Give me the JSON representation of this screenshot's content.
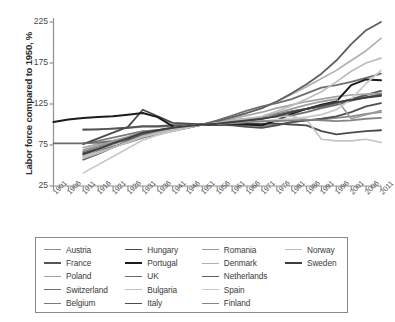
{
  "chart_data": {
    "type": "line",
    "title": "",
    "xlabel": "",
    "ylabel": "Labor force compared to 1950, %",
    "xlim": [
      1901,
      2011
    ],
    "ylim": [
      25,
      235
    ],
    "yticks": [
      25,
      75,
      125,
      175,
      225
    ],
    "grid": false,
    "legend_position": "below-plot",
    "x": [
      1901,
      1906,
      1911,
      1916,
      1921,
      1926,
      1931,
      1936,
      1941,
      1946,
      1951,
      1956,
      1961,
      1966,
      1971,
      1976,
      1981,
      1986,
      1991,
      1996,
      2001,
      2006,
      2011
    ],
    "series": [
      {
        "name": "Austria",
        "color": "#8c8c8c",
        "width": 1.7,
        "values": [
          null,
          null,
          93,
          94,
          95,
          96,
          97,
          97,
          98,
          99,
          100,
          100,
          100,
          99,
          98,
          100,
          103,
          105,
          106,
          108,
          110,
          113,
          115
        ]
      },
      {
        "name": "France",
        "color": "#555555",
        "width": 1.9,
        "values": [
          null,
          null,
          94,
          94,
          95,
          96,
          98,
          98,
          99,
          99,
          100,
          100,
          102,
          104,
          107,
          112,
          116,
          119,
          122,
          126,
          131,
          136,
          141
        ]
      },
      {
        "name": "Poland",
        "color": "#a3a3a3",
        "width": 1.7,
        "values": [
          null,
          null,
          72,
          76,
          80,
          84,
          88,
          90,
          93,
          96,
          100,
          103,
          107,
          111,
          115,
          120,
          124,
          128,
          131,
          134,
          136,
          137,
          138
        ]
      },
      {
        "name": "Switzerland",
        "color": "#6e6e6e",
        "width": 1.8,
        "values": [
          null,
          null,
          63,
          68,
          73,
          78,
          84,
          88,
          92,
          96,
          100,
          105,
          111,
          117,
          122,
          126,
          131,
          138,
          145,
          148,
          152,
          157,
          162
        ]
      },
      {
        "name": "Belgium",
        "color": "#7a7a7a",
        "width": 1.8,
        "values": [
          null,
          null,
          77,
          80,
          84,
          88,
          92,
          93,
          95,
          97,
          100,
          101,
          103,
          106,
          109,
          113,
          116,
          119,
          122,
          126,
          130,
          133,
          136
        ]
      },
      {
        "name": "Hungary",
        "color": "#4a4a4a",
        "width": 1.8,
        "values": [
          null,
          null,
          76,
          83,
          90,
          97,
          118,
          110,
          102,
          101,
          100,
          100,
          100,
          101,
          101,
          101,
          100,
          99,
          92,
          88,
          90,
          92,
          93
        ]
      },
      {
        "name": "Portugal",
        "color": "#1c1c1c",
        "width": 2.0,
        "values": [
          103,
          106,
          108,
          109,
          110,
          112,
          114,
          109,
          98,
          null,
          100,
          100,
          100,
          100,
          99,
          105,
          113,
          119,
          124,
          128,
          148,
          155,
          154
        ]
      },
      {
        "name": "UK",
        "color": "#6b6b6b",
        "width": 1.8,
        "values": [
          77,
          77,
          77,
          78,
          80,
          82,
          86,
          89,
          93,
          96,
          100,
          102,
          105,
          107,
          108,
          110,
          111,
          115,
          120,
          124,
          129,
          133,
          137
        ]
      },
      {
        "name": "Bulgaria",
        "color": "#c4c4c4",
        "width": 1.7,
        "values": [
          null,
          null,
          60,
          66,
          72,
          78,
          85,
          89,
          93,
          96,
          100,
          102,
          105,
          107,
          109,
          110,
          110,
          106,
          82,
          80,
          80,
          82,
          78
        ]
      },
      {
        "name": "Italy",
        "color": "#4f4f4f",
        "width": 1.8,
        "values": [
          null,
          null,
          66,
          71,
          76,
          82,
          88,
          91,
          94,
          97,
          100,
          100,
          99,
          97,
          96,
          99,
          103,
          105,
          107,
          110,
          115,
          122,
          126
        ]
      },
      {
        "name": "Romania",
        "color": "#9b9b9b",
        "width": 1.7,
        "values": [
          null,
          null,
          69,
          74,
          80,
          85,
          91,
          93,
          96,
          98,
          100,
          102,
          104,
          106,
          109,
          114,
          119,
          124,
          128,
          131,
          107,
          112,
          117
        ]
      },
      {
        "name": "Denmark",
        "color": "#b0b0b0",
        "width": 1.7,
        "values": [
          null,
          null,
          62,
          69,
          76,
          83,
          90,
          93,
          96,
          98,
          100,
          104,
          109,
          114,
          120,
          128,
          137,
          146,
          156,
          166,
          178,
          190,
          205
        ]
      },
      {
        "name": "Netherlands",
        "color": "#5f5f5f",
        "width": 1.8,
        "values": [
          null,
          null,
          57,
          64,
          72,
          80,
          88,
          91,
          95,
          97,
          100,
          104,
          109,
          114,
          120,
          128,
          138,
          149,
          162,
          178,
          198,
          215,
          225
        ]
      },
      {
        "name": "Spain",
        "color": "#c9c9c9",
        "width": 1.7,
        "values": [
          null,
          null,
          41,
          51,
          61,
          71,
          81,
          87,
          92,
          96,
          100,
          101,
          102,
          103,
          104,
          106,
          107,
          109,
          112,
          118,
          131,
          150,
          166
        ]
      },
      {
        "name": "Finland",
        "color": "#858585",
        "width": 1.8,
        "values": [
          null,
          null,
          67,
          72,
          78,
          84,
          90,
          93,
          96,
          98,
          100,
          101,
          102,
          103,
          104,
          104,
          105,
          106,
          105,
          104,
          105,
          107,
          108
        ]
      },
      {
        "name": "Norway",
        "color": "#bdbdbd",
        "width": 1.7,
        "values": [
          null,
          null,
          59,
          65,
          72,
          79,
          86,
          90,
          94,
          97,
          100,
          102,
          104,
          107,
          110,
          116,
          123,
          131,
          140,
          152,
          165,
          175,
          181
        ]
      },
      {
        "name": "Sweden",
        "color": "#3f3f3f",
        "width": 1.9,
        "values": [
          null,
          null,
          64,
          70,
          77,
          83,
          90,
          93,
          96,
          98,
          100,
          101,
          103,
          105,
          107,
          110,
          115,
          119,
          123,
          127,
          130,
          133,
          135
        ]
      }
    ]
  },
  "axes": {
    "y_title": "Labor force compared to 1950, %",
    "y_tick_labels": [
      "225",
      "175",
      "125",
      "75",
      "25"
    ],
    "x_tick_labels": [
      "1901",
      "1906",
      "1911",
      "1916",
      "1921",
      "1926",
      "1931",
      "1936",
      "1941",
      "1946",
      "1951",
      "1956",
      "1961",
      "1966",
      "1971",
      "1976",
      "1981",
      "1986",
      "1991",
      "1996",
      "2001",
      "2006",
      "2011"
    ]
  },
  "legend": {
    "columns": [
      {
        "items": [
          {
            "label": "Austria",
            "color": "#8c8c8c",
            "width": 1.7
          },
          {
            "label": "France",
            "color": "#555555",
            "width": 2.0
          },
          {
            "label": "Poland",
            "color": "#a3a3a3",
            "width": 1.6
          },
          {
            "label": "Switzerland",
            "color": "#6e6e6e",
            "width": 1.8
          },
          {
            "label": "Belgium",
            "color": "#7a7a7a",
            "width": 1.8
          }
        ]
      },
      {
        "items": [
          {
            "label": "Hungary",
            "color": "#4a4a4a",
            "width": 1.9
          },
          {
            "label": "Portugal",
            "color": "#1c1c1c",
            "width": 2.3
          },
          {
            "label": "UK",
            "color": "#6b6b6b",
            "width": 1.8
          },
          {
            "label": "Bulgaria",
            "color": "#c4c4c4",
            "width": 1.6
          },
          {
            "label": "Italy",
            "color": "#4f4f4f",
            "width": 1.9
          }
        ]
      },
      {
        "items": [
          {
            "label": "Romania",
            "color": "#9b9b9b",
            "width": 1.7
          },
          {
            "label": "Denmark",
            "color": "#b0b0b0",
            "width": 1.6
          },
          {
            "label": "Netherlands",
            "color": "#5f5f5f",
            "width": 1.9
          },
          {
            "label": "Spain",
            "color": "#c9c9c9",
            "width": 1.5
          },
          {
            "label": "Finland",
            "color": "#858585",
            "width": 1.8
          }
        ]
      },
      {
        "items": [
          {
            "label": "Norway",
            "color": "#bdbdbd",
            "width": 1.6
          },
          {
            "label": "Sweden",
            "color": "#3f3f3f",
            "width": 2.0
          }
        ]
      }
    ]
  }
}
